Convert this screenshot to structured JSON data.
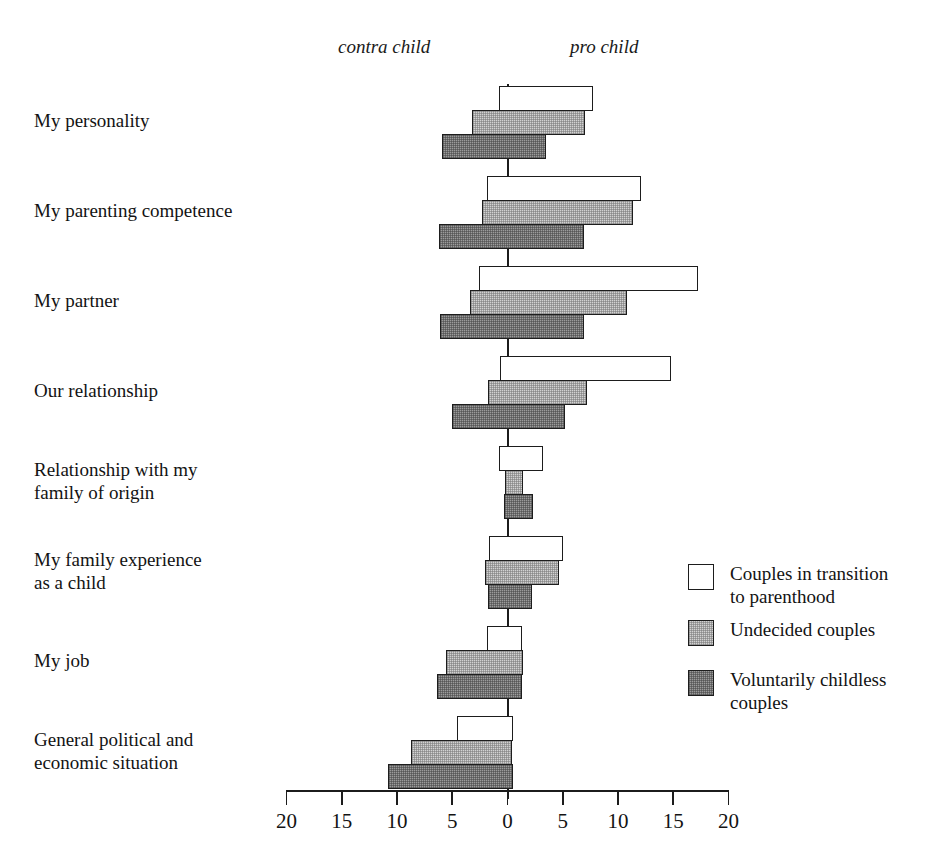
{
  "chart_data": {
    "type": "bar",
    "orientation": "horizontal-diverging",
    "title": "",
    "xlabel": "",
    "ylabel": "",
    "xlim": [
      -20,
      20
    ],
    "grid": false,
    "axis_direction_labels": {
      "negative": "contra child",
      "positive": "pro child"
    },
    "xticks": [
      -20,
      -15,
      -10,
      -5,
      0,
      5,
      10,
      15,
      20
    ],
    "xtick_labels": [
      "20",
      "15",
      "10",
      "5",
      "0",
      "5",
      "10",
      "15",
      "20"
    ],
    "legend_position": "right-middle",
    "categories": [
      "My personality",
      "My parenting competence",
      "My partner",
      "Our relationship",
      "Relationship with my\nfamily of origin",
      "My family experience\nas a child",
      "My job",
      "General political and\neconomic situation"
    ],
    "series": [
      {
        "name": "Couples in transition to parenthood",
        "key": "s0",
        "color": "#ffffff",
        "contra": [
          0.8,
          1.9,
          2.6,
          0.7,
          0.8,
          1.7,
          1.9,
          4.6
        ],
        "pro": [
          7.7,
          12.1,
          17.2,
          14.8,
          3.2,
          5.0,
          1.3,
          0.5
        ]
      },
      {
        "name": "Undecided couples",
        "key": "s1",
        "color": "#d2d2d2",
        "contra": [
          3.2,
          2.3,
          3.4,
          1.8,
          0.2,
          2.0,
          5.6,
          8.7
        ],
        "pro": [
          7.0,
          11.4,
          10.8,
          7.2,
          1.4,
          4.7,
          1.4,
          0.4
        ]
      },
      {
        "name": "Voluntarily childless couples",
        "key": "s2",
        "color": "#9b9b9b",
        "contra": [
          5.9,
          6.2,
          6.1,
          5.0,
          0.3,
          1.8,
          6.4,
          10.8
        ],
        "pro": [
          3.5,
          6.9,
          6.9,
          5.2,
          2.3,
          2.2,
          1.3,
          0.5
        ]
      }
    ]
  },
  "legend": {
    "items": [
      {
        "label": "Couples in transition\nto parenthood",
        "swatch": "s0"
      },
      {
        "label": "Undecided couples",
        "swatch": "s1"
      },
      {
        "label": "Voluntarily childless\ncouples",
        "swatch": "s2"
      }
    ]
  }
}
